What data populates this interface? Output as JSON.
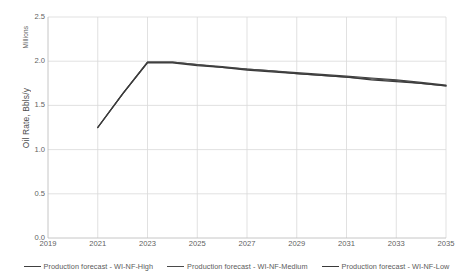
{
  "chart_data": {
    "type": "line",
    "title": "",
    "xlabel": "",
    "ylabel": "Oil Rate, Bbls/y",
    "y_unit_label": "Millions",
    "xlim": [
      2019,
      2035
    ],
    "ylim": [
      0.0,
      2.5
    ],
    "grid": true,
    "legend_position": "bottom",
    "y_ticks": [
      "2.5",
      "2.0",
      "1.5",
      "1.0",
      "0.5",
      "0.0"
    ],
    "y_tick_values": [
      2.5,
      2.0,
      1.5,
      1.0,
      0.5,
      0.0
    ],
    "x_ticks": [
      "2019",
      "2021",
      "2023",
      "2025",
      "2027",
      "2029",
      "2031",
      "2033",
      "2035"
    ],
    "x_tick_values": [
      2019,
      2021,
      2023,
      2025,
      2027,
      2029,
      2031,
      2033,
      2035
    ],
    "x": [
      2021,
      2022,
      2023,
      2024,
      2025,
      2026,
      2027,
      2028,
      2029,
      2030,
      2031,
      2032,
      2033,
      2034,
      2035
    ],
    "series": [
      {
        "name": "Production forecast - WI-NF-High",
        "color": "#404040",
        "values": [
          1.25,
          1.63,
          1.99,
          1.99,
          1.96,
          1.94,
          1.91,
          1.89,
          1.87,
          1.85,
          1.83,
          1.81,
          1.79,
          1.76,
          1.73
        ]
      },
      {
        "name": "Production forecast - WI-NF-Medium",
        "color": "#4a4a4a",
        "values": [
          1.25,
          1.63,
          1.99,
          1.99,
          1.96,
          1.93,
          1.91,
          1.89,
          1.86,
          1.84,
          1.82,
          1.8,
          1.78,
          1.75,
          1.72
        ]
      },
      {
        "name": "Production forecast - WI-NF-Low",
        "color": "#3a3a3a",
        "values": [
          1.25,
          1.63,
          1.98,
          1.98,
          1.95,
          1.93,
          1.9,
          1.88,
          1.86,
          1.84,
          1.82,
          1.79,
          1.77,
          1.75,
          1.72
        ]
      }
    ]
  },
  "legend": {
    "items": [
      {
        "label": "Production forecast - WI-NF-High"
      },
      {
        "label": "Production forecast - WI-NF-Medium"
      },
      {
        "label": "Production forecast - WI-NF-Low"
      }
    ]
  },
  "colors": {
    "grid": "#d9d9d9",
    "axis": "#bfbfbf",
    "text": "#5f5f5f",
    "line": "#404040",
    "background": "#ffffff"
  }
}
